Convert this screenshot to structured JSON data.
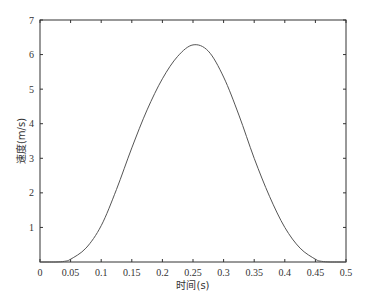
{
  "chart_data": {
    "type": "line",
    "title": "",
    "xlabel": "时间(s)",
    "ylabel": "速度(m/s)",
    "xlim": [
      0,
      0.5
    ],
    "ylim": [
      0,
      7
    ],
    "grid": false,
    "legend": null,
    "x_ticks": [
      "0",
      "0.05",
      "0.1",
      "0.15",
      "0.2",
      "0.25",
      "0.3",
      "0.35",
      "0.4",
      "0.45",
      "0.5"
    ],
    "y_ticks": [
      "1",
      "2",
      "3",
      "4",
      "5",
      "6",
      "7"
    ],
    "series": [
      {
        "name": "速度",
        "color": "#555555",
        "x": [
          0,
          0.025,
          0.04,
          0.05,
          0.075,
          0.1,
          0.125,
          0.15,
          0.175,
          0.2,
          0.225,
          0.25,
          0.275,
          0.3,
          0.325,
          0.35,
          0.375,
          0.4,
          0.425,
          0.45,
          0.46,
          0.475,
          0.5
        ],
        "values": [
          0,
          0.0,
          0.02,
          0.08,
          0.4,
          1.05,
          2.1,
          3.3,
          4.4,
          5.3,
          5.95,
          6.28,
          6.1,
          5.35,
          4.25,
          3.0,
          1.9,
          1.0,
          0.4,
          0.08,
          0.02,
          0.0,
          0.0
        ]
      }
    ]
  }
}
